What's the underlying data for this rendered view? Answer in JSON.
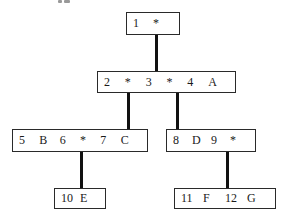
{
  "diagram": {
    "type": "tree",
    "nodes": [
      {
        "id": "n1",
        "keys": [
          "1",
          "*"
        ],
        "box": [
          126,
          12,
          54,
          23
        ]
      },
      {
        "id": "n2",
        "keys": [
          "2",
          "*",
          "3",
          "*",
          "4",
          "A"
        ],
        "box": [
          97,
          71,
          139,
          22
        ]
      },
      {
        "id": "n3",
        "keys": [
          "5",
          "B",
          "6",
          "*",
          "7",
          "C"
        ],
        "box": [
          12,
          129,
          136,
          23
        ]
      },
      {
        "id": "n4",
        "keys": [
          "8",
          "D",
          "9",
          "*"
        ],
        "box": [
          166,
          129,
          90,
          23
        ]
      },
      {
        "id": "n5",
        "keys": [
          "10",
          "E"
        ],
        "box": [
          54,
          188,
          52,
          21
        ]
      },
      {
        "id": "n6",
        "keys": [
          "11",
          "F",
          "12",
          "G"
        ],
        "box": [
          174,
          188,
          102,
          21
        ]
      }
    ],
    "edges": [
      {
        "from": "n1",
        "to": "n2",
        "x": 155,
        "y1": 35,
        "y2": 71
      },
      {
        "from": "n2",
        "to": "n3",
        "x": 127,
        "y1": 93,
        "y2": 129
      },
      {
        "from": "n2",
        "to": "n4",
        "x": 176,
        "y1": 93,
        "y2": 129
      },
      {
        "from": "n3",
        "to": "n5",
        "x": 80,
        "y1": 152,
        "y2": 188
      },
      {
        "from": "n4",
        "to": "n6",
        "x": 226,
        "y1": 152,
        "y2": 188
      }
    ]
  }
}
